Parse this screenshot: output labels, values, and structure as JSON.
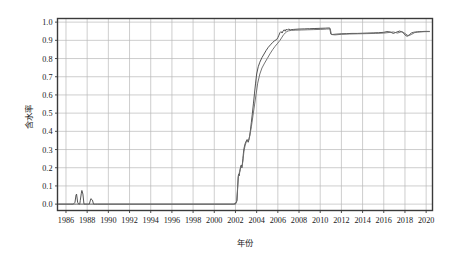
{
  "figure": {
    "background_color": "#ffffff",
    "plot_border_color": "#3a3a3a",
    "grid_color": "#b9b9b9"
  },
  "chart_data": {
    "type": "line",
    "title": "",
    "xlabel": "年份",
    "ylabel": "含水率",
    "xlim": [
      1985.2,
      2020.6
    ],
    "ylim": [
      -0.035,
      1.02
    ],
    "grid": true,
    "legend": null,
    "yticks": [
      "0.0",
      "0.1",
      "0.2",
      "0.3",
      "0.4",
      "0.5",
      "0.6",
      "0.7",
      "0.8",
      "0.9",
      "1.0"
    ],
    "ytick_values": [
      0.0,
      0.1,
      0.2,
      0.3,
      0.4,
      0.5,
      0.6,
      0.7,
      0.8,
      0.9,
      1.0
    ],
    "xticks": [
      "1986",
      "1988",
      "1990",
      "1992",
      "1994",
      "1996",
      "1998",
      "2000",
      "2002",
      "2004",
      "2006",
      "2008",
      "2010",
      "2012",
      "2014",
      "2016",
      "2018",
      "2020"
    ],
    "xtick_values": [
      1986,
      1988,
      1990,
      1992,
      1994,
      1996,
      1998,
      2000,
      2002,
      2004,
      2006,
      2008,
      2010,
      2012,
      2014,
      2016,
      2018,
      2020
    ],
    "series": [
      {
        "name": "series-1",
        "color": "#4a4a4a",
        "x": [
          1985.3,
          1986.0,
          1986.4,
          1986.7,
          1986.85,
          1986.95,
          1987.0,
          1987.1,
          1987.2,
          1987.3,
          1987.35,
          1987.45,
          1987.5,
          1987.6,
          1987.7,
          1987.8,
          1987.9,
          1988.0,
          1988.1,
          1988.2,
          1988.35,
          1988.5,
          1988.6,
          1988.8,
          1989.0,
          1990.0,
          1992.0,
          1994.0,
          1996.0,
          1998.0,
          2000.0,
          2001.5,
          2002.0,
          2002.15,
          2002.2,
          2002.25,
          2002.3,
          2002.35,
          2002.4,
          2002.45,
          2002.5,
          2002.55,
          2002.6,
          2002.65,
          2002.7,
          2002.75,
          2002.8,
          2002.9,
          2003.0,
          2003.1,
          2003.2,
          2003.3,
          2003.4,
          2003.5,
          2003.6,
          2003.7,
          2003.8,
          2003.9,
          2004.0,
          2004.15,
          2004.3,
          2004.5,
          2004.7,
          2004.9,
          2005.1,
          2005.3,
          2005.5,
          2005.7,
          2005.9,
          2006.0,
          2006.1,
          2006.2,
          2006.3,
          2006.4,
          2006.5,
          2006.6,
          2006.7,
          2006.8,
          2006.9,
          2007.0,
          2007.2,
          2007.5,
          2008.0,
          2008.5,
          2009.0,
          2009.5,
          2010.0,
          2010.5,
          2010.9,
          2011.0,
          2011.1,
          2011.5,
          2012.0,
          2012.5,
          2013.0,
          2013.5,
          2014.0,
          2014.5,
          2015.0,
          2015.5,
          2016.0,
          2016.3,
          2016.6,
          2016.9,
          2017.2,
          2017.5,
          2017.8,
          2018.0,
          2018.2,
          2018.4,
          2018.6,
          2018.8,
          2019.0,
          2019.2,
          2019.4,
          2019.6,
          2019.8,
          2020.0,
          2020.3
        ],
        "y": [
          0.0,
          0.0,
          0.0,
          0.0,
          0.01,
          0.05,
          0.055,
          0.01,
          0.0,
          0.0,
          0.02,
          0.06,
          0.075,
          0.055,
          0.0,
          0.0,
          0.0,
          0.0,
          0.0,
          0.0,
          0.03,
          0.022,
          0.0,
          0.0,
          0.0,
          0.0,
          0.0,
          0.0,
          0.0,
          0.0,
          0.0,
          0.0,
          0.0,
          0.02,
          0.08,
          0.15,
          0.165,
          0.155,
          0.175,
          0.19,
          0.205,
          0.215,
          0.2,
          0.22,
          0.25,
          0.28,
          0.305,
          0.33,
          0.345,
          0.355,
          0.34,
          0.36,
          0.4,
          0.45,
          0.5,
          0.555,
          0.61,
          0.665,
          0.715,
          0.755,
          0.78,
          0.805,
          0.825,
          0.845,
          0.862,
          0.875,
          0.888,
          0.898,
          0.905,
          0.915,
          0.928,
          0.942,
          0.948,
          0.94,
          0.952,
          0.958,
          0.95,
          0.962,
          0.956,
          0.962,
          0.958,
          0.96,
          0.962,
          0.963,
          0.964,
          0.965,
          0.966,
          0.967,
          0.968,
          0.935,
          0.932,
          0.934,
          0.936,
          0.937,
          0.938,
          0.938,
          0.939,
          0.94,
          0.941,
          0.942,
          0.944,
          0.948,
          0.946,
          0.938,
          0.945,
          0.951,
          0.944,
          0.93,
          0.922,
          0.93,
          0.94,
          0.944,
          0.946,
          0.947,
          0.948,
          0.948,
          0.949,
          0.949,
          0.949
        ]
      },
      {
        "name": "series-2",
        "color": "#6d6d6d",
        "x": [
          1985.3,
          1986.0,
          1987.0,
          1988.0,
          1989.0,
          1992.0,
          1996.0,
          2000.0,
          2001.8,
          2002.1,
          2002.2,
          2002.3,
          2002.4,
          2002.5,
          2002.6,
          2002.7,
          2002.8,
          2002.9,
          2003.0,
          2003.1,
          2003.2,
          2003.35,
          2003.5,
          2003.65,
          2003.8,
          2003.95,
          2004.1,
          2004.3,
          2004.5,
          2004.75,
          2005.0,
          2005.25,
          2005.5,
          2005.75,
          2006.0,
          2006.2,
          2006.4,
          2006.55,
          2006.7,
          2006.85,
          2007.0,
          2007.3,
          2007.7,
          2008.2,
          2008.8,
          2009.4,
          2010.0,
          2010.6,
          2010.95,
          2011.05,
          2011.4,
          2012.0,
          2012.8,
          2013.6,
          2014.4,
          2015.2,
          2016.0,
          2016.5,
          2016.9,
          2017.3,
          2017.7,
          2018.0,
          2018.3,
          2018.6,
          2018.9,
          2019.2,
          2019.6,
          2020.0,
          2020.3
        ],
        "y": [
          0.0,
          0.0,
          0.0,
          0.0,
          0.0,
          0.0,
          0.0,
          0.0,
          0.0,
          0.01,
          0.09,
          0.16,
          0.18,
          0.21,
          0.2,
          0.235,
          0.29,
          0.32,
          0.338,
          0.352,
          0.345,
          0.375,
          0.425,
          0.485,
          0.545,
          0.605,
          0.665,
          0.715,
          0.748,
          0.775,
          0.8,
          0.825,
          0.848,
          0.868,
          0.885,
          0.9,
          0.918,
          0.932,
          0.94,
          0.948,
          0.952,
          0.955,
          0.956,
          0.957,
          0.958,
          0.959,
          0.96,
          0.962,
          0.963,
          0.932,
          0.93,
          0.933,
          0.935,
          0.936,
          0.937,
          0.938,
          0.94,
          0.943,
          0.946,
          0.94,
          0.948,
          0.938,
          0.925,
          0.932,
          0.942,
          0.945,
          0.947,
          0.948,
          0.948
        ]
      }
    ]
  }
}
